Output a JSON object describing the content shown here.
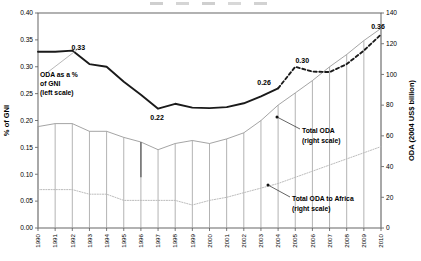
{
  "chart_data": {
    "type": "line",
    "title": "",
    "xlabel": "",
    "ylabel": "% of GNI",
    "y2label": "ODA (2004 US$ billion)",
    "ylim": [
      0.0,
      0.4
    ],
    "y2lim": [
      0,
      140
    ],
    "grid": false,
    "legend_position": "inline-annotations",
    "categories": [
      "1990",
      "1991",
      "1992",
      "1993",
      "1994",
      "1995",
      "1996",
      "1997",
      "1998",
      "1999",
      "2000",
      "2001",
      "2002",
      "2003",
      "2004",
      "2005",
      "2006",
      "2007",
      "2008",
      "2009",
      "2010"
    ],
    "yticks": [
      "0.00",
      "0.05",
      "0.10",
      "0.15",
      "0.20",
      "0.25",
      "0.30",
      "0.35",
      "0.40"
    ],
    "y2ticks": [
      "0",
      "20",
      "40",
      "60",
      "80",
      "100",
      "120",
      "140"
    ],
    "series": [
      {
        "name": "ODA as a % of GNI",
        "scale": "left",
        "style": "solid-thick",
        "color": "#1a1a1a",
        "x": [
          "1990",
          "1991",
          "1992",
          "1993",
          "1994",
          "1995",
          "1996",
          "1997",
          "1998",
          "1999",
          "2000",
          "2001",
          "2002",
          "2003",
          "2004"
        ],
        "values": [
          0.328,
          0.328,
          0.33,
          0.305,
          0.3,
          0.272,
          0.248,
          0.222,
          0.231,
          0.224,
          0.223,
          0.225,
          0.232,
          0.245,
          0.26
        ]
      },
      {
        "name": "ODA as a % of GNI (projected)",
        "scale": "left",
        "style": "dashed",
        "color": "#1a1a1a",
        "x": [
          "2004",
          "2005",
          "2006",
          "2007",
          "2008",
          "2009",
          "2010"
        ],
        "values": [
          0.26,
          0.3,
          0.291,
          0.29,
          0.305,
          0.33,
          0.36
        ]
      },
      {
        "name": "Total ODA",
        "scale": "right",
        "style": "thin-with-droplines",
        "color": "#9a9a9a",
        "x": [
          "1990",
          "1991",
          "1992",
          "1993",
          "1994",
          "1995",
          "1996",
          "1997",
          "1998",
          "1999",
          "2000",
          "2001",
          "2002",
          "2003",
          "2004",
          "2005",
          "2006",
          "2007",
          "2008",
          "2009",
          "2010"
        ],
        "values": [
          66,
          68,
          68,
          63,
          63,
          59,
          56,
          51,
          55,
          57,
          55,
          58,
          62,
          70,
          80,
          88,
          96,
          105,
          113,
          122,
          130
        ]
      },
      {
        "name": "Total ODA to Africa",
        "scale": "right",
        "style": "dotted-thin",
        "color": "#b4b4b4",
        "x": [
          "1990",
          "1991",
          "1992",
          "1993",
          "1994",
          "1995",
          "1996",
          "1997",
          "1998",
          "1999",
          "2000",
          "2001",
          "2002",
          "2003",
          "2004",
          "2005",
          "2006",
          "2007",
          "2008",
          "2009",
          "2010"
        ],
        "values": [
          25,
          25,
          25,
          22,
          22,
          18,
          18,
          18,
          18,
          15,
          18,
          20,
          23,
          26,
          29,
          33,
          37,
          41,
          45,
          49,
          53
        ]
      }
    ],
    "data_labels": [
      {
        "text": "0.33",
        "x": "1992",
        "value": 0.33
      },
      {
        "text": "0.22",
        "x": "1997",
        "value": 0.222
      },
      {
        "text": "0.26",
        "x": "2004",
        "value": 0.26
      },
      {
        "text": "0.30",
        "x": "2005",
        "value": 0.3
      },
      {
        "text": "0.36",
        "x": "2010",
        "value": 0.36
      }
    ],
    "annotations": [
      {
        "id": "anno-gni",
        "line1": "ODA as a %",
        "line2": "of GNI",
        "line3": "(left scale)"
      },
      {
        "id": "anno-total-oda",
        "line1": "Total ODA",
        "line2": "(right scale)",
        "line3": ""
      },
      {
        "id": "anno-africa",
        "line1": "Total ODA to Africa",
        "line2": "(right scale)",
        "line3": ""
      }
    ]
  }
}
